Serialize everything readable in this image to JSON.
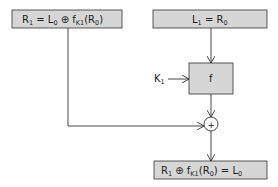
{
  "diagram": {
    "type": "feistel-decryption-round",
    "colors": {
      "box_fill": "#d6d6d6",
      "stroke": "#333333",
      "background": "#ffffff"
    },
    "nodes": {
      "top_left": {
        "parts": [
          "R",
          "1",
          " = L",
          "0",
          " ⊕ f",
          "K1",
          "(R",
          "0",
          ")"
        ],
        "text": "R1 = L0 ⊕ fK1(R0)"
      },
      "top_right": {
        "parts": [
          "L",
          "1",
          " = R",
          "0"
        ],
        "text": "L1 = R0"
      },
      "function": {
        "label": "f"
      },
      "key": {
        "label": "K",
        "sub": "1",
        "text": "K1"
      },
      "xor": {
        "label": "+"
      },
      "bottom": {
        "parts": [
          "R",
          "1",
          " ⊕ f",
          "K1",
          "(R",
          "0",
          ") = L",
          "0"
        ],
        "text": "R1 ⊕ fK1(R0) = L0"
      }
    },
    "edges": [
      {
        "from": "top_right",
        "to": "function"
      },
      {
        "from": "key",
        "to": "function"
      },
      {
        "from": "function",
        "to": "xor"
      },
      {
        "from": "top_left",
        "to": "xor"
      },
      {
        "from": "xor",
        "to": "bottom"
      }
    ]
  }
}
